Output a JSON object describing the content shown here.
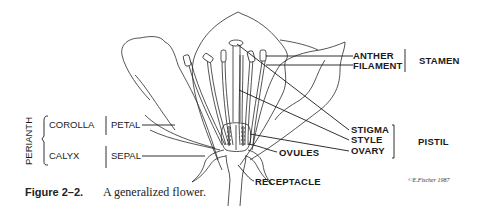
{
  "figure": {
    "caption_number": "Figure 2–2.",
    "caption_text": "A generalized flower.",
    "signature": "©E.Fischer 1987"
  },
  "labels": {
    "anther": "ANTHER",
    "filament": "FILAMENT",
    "stamen": "STAMEN",
    "stigma": "STIGMA",
    "style": "STYLE",
    "ovary": "OVARY",
    "pistil": "PISTIL",
    "ovules": "OVULES",
    "receptacle": "RECEPTACLE",
    "perianth": "PERIANTH",
    "corolla": "COROLLA",
    "calyx": "CALYX",
    "petal": "PETAL",
    "sepal": "SEPAL"
  }
}
